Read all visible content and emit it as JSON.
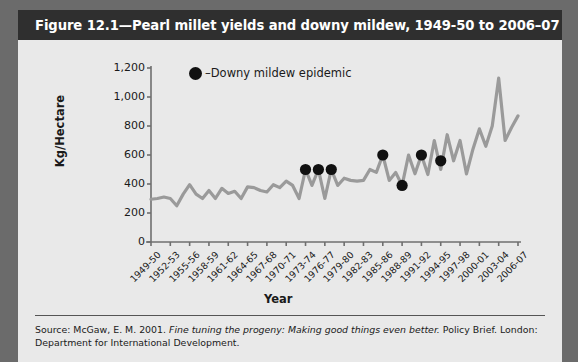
{
  "figure": {
    "title": "Figure 12.1—Pearl millet yields and downy mildew, 1949-50 to 2006–07",
    "source_prefix": "Source: McGaw, E. M. 2001. ",
    "source_italic": "Fine tuning the progeny: Making good things even better.",
    "source_suffix": " Policy Brief. London: Department for International Development."
  },
  "colors": {
    "title_bar": "#2f2f2f",
    "card_background": "#e9e9e9",
    "page_background": "#6b6b6b",
    "line": "#9a9a9a",
    "marker": "#111111",
    "axis": "#6f6f6f",
    "text": "#1a1a1a"
  },
  "legend": {
    "marker_label": "–Downy mildew epidemic",
    "marker_icon": "filled-circle-icon"
  },
  "chart_data": {
    "type": "line",
    "title": "Pearl millet yields and downy mildew, 1949-50 to 2006–07",
    "xlabel": "Year",
    "ylabel": "Kg/Hectare",
    "ylim": [
      0,
      1200
    ],
    "yticks": [
      "0",
      "200",
      "400",
      "600",
      "800",
      "1,000",
      "1,200"
    ],
    "ytick_values": [
      0,
      200,
      400,
      600,
      800,
      1000,
      1200
    ],
    "grid": false,
    "legend_position": "top-center",
    "xtick_labels": [
      "1949-50",
      "1952-53",
      "1955-56",
      "1958-59",
      "1961-62",
      "1964-65",
      "1967-68",
      "1970-71",
      "1973-74",
      "1976-77",
      "1979-80",
      "1982-83",
      "1985-86",
      "1988-89",
      "1991-92",
      "1994-95",
      "1997-98",
      "2000-01",
      "2003-04",
      "2006-07"
    ],
    "xtick_step_years": 3,
    "categories": [
      "1949-50",
      "1950-51",
      "1951-52",
      "1952-53",
      "1953-54",
      "1954-55",
      "1955-56",
      "1956-57",
      "1957-58",
      "1958-59",
      "1959-60",
      "1960-61",
      "1961-62",
      "1962-63",
      "1963-64",
      "1964-65",
      "1965-66",
      "1966-67",
      "1967-68",
      "1968-69",
      "1969-70",
      "1970-71",
      "1971-72",
      "1972-73",
      "1973-74",
      "1974-75",
      "1975-76",
      "1976-77",
      "1977-78",
      "1978-79",
      "1979-80",
      "1980-81",
      "1981-82",
      "1982-83",
      "1983-84",
      "1984-85",
      "1985-86",
      "1986-87",
      "1987-88",
      "1988-89",
      "1989-90",
      "1990-91",
      "1991-92",
      "1992-93",
      "1993-94",
      "1994-95",
      "1995-96",
      "1996-97",
      "1997-98",
      "1998-99",
      "1999-00",
      "2000-01",
      "2001-02",
      "2002-03",
      "2003-04",
      "2004-05",
      "2005-06",
      "2006-07"
    ],
    "series": [
      {
        "name": "Pearl millet yield",
        "values": [
          295,
          300,
          310,
          300,
          250,
          330,
          395,
          330,
          300,
          355,
          300,
          370,
          335,
          350,
          300,
          380,
          375,
          355,
          345,
          395,
          375,
          420,
          390,
          300,
          500,
          390,
          500,
          300,
          500,
          390,
          440,
          425,
          420,
          425,
          500,
          480,
          600,
          425,
          480,
          390,
          600,
          470,
          600,
          465,
          700,
          500,
          740,
          560,
          700,
          470,
          640,
          780,
          660,
          800,
          1130,
          700,
          790,
          870
        ]
      }
    ],
    "epidemic_markers": [
      {
        "year": "1973-74",
        "value": 500
      },
      {
        "year": "1975-76",
        "value": 500
      },
      {
        "year": "1977-78",
        "value": 500
      },
      {
        "year": "1985-86",
        "value": 600
      },
      {
        "year": "1988-89",
        "value": 390
      },
      {
        "year": "1991-92",
        "value": 600
      },
      {
        "year": "1994-95",
        "value": 560
      }
    ]
  }
}
